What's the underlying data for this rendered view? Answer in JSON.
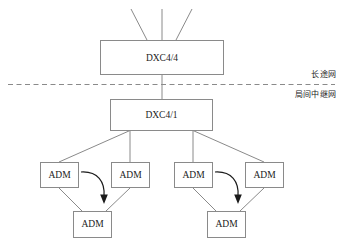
{
  "diagram": {
    "type": "network-topology",
    "background_color": "#ffffff",
    "line_color": "#8a8a8a",
    "text_color": "#1b1b1b",
    "arrow_color": "#1b1b1b",
    "nodes": {
      "dxc44": {
        "label": "DXC4/4"
      },
      "dxc41": {
        "label": "DXC4/1"
      },
      "adm_left_1": {
        "label": "ADM"
      },
      "adm_left_2": {
        "label": "ADM"
      },
      "adm_left_3": {
        "label": "ADM"
      },
      "adm_right_1": {
        "label": "ADM"
      },
      "adm_right_2": {
        "label": "ADM"
      },
      "adm_right_3": {
        "label": "ADM"
      }
    },
    "zone_labels": {
      "upper": "长途网",
      "lower": "局间中继网"
    }
  }
}
